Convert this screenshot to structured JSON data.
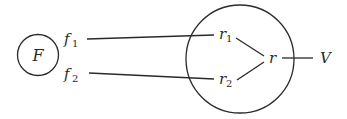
{
  "diagram": {
    "source_node": {
      "label": "F"
    },
    "inputs": [
      {
        "base": "f",
        "subscript": "1"
      },
      {
        "base": "f",
        "subscript": "2"
      }
    ],
    "process_node": {
      "internal_inputs": [
        {
          "base": "r",
          "subscript": "1"
        },
        {
          "base": "r",
          "subscript": "2"
        }
      ],
      "output_internal": {
        "label": "r"
      }
    },
    "output": {
      "label": "V"
    }
  }
}
